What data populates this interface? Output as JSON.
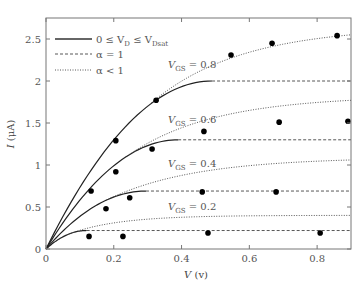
{
  "chart_data": {
    "type": "line",
    "title": "",
    "xlabel": "V (v)",
    "ylabel": "I (μA)",
    "xlim": [
      0,
      0.9
    ],
    "ylim": [
      0,
      2.75
    ],
    "xticks": [
      0,
      0.2,
      0.4,
      0.6,
      0.8
    ],
    "xtick_labels": [
      "0",
      "0.2",
      "0.4",
      "0.6",
      "0.8"
    ],
    "yticks": [
      0,
      0.5,
      1,
      1.5,
      2,
      2.5
    ],
    "ytick_labels": [
      "0",
      "0.5",
      "1",
      "1.5",
      "2",
      "2.5"
    ],
    "grid": false,
    "legend_position": "upper left",
    "legend": [
      {
        "label": "0 ≤ V_D ≤ V_Dsat",
        "style": "solid"
      },
      {
        "label": "α = 1",
        "style": "dashed"
      },
      {
        "label": "α < 1",
        "style": "dotted"
      }
    ],
    "series": [
      {
        "name": "V_GS = 0.8",
        "vgs": 0.8,
        "vdsat": 0.49,
        "isat": 2.0,
        "dotted_end": 2.55,
        "label_pos": [
          0.36,
          2.15
        ]
      },
      {
        "name": "V_GS = 0.6",
        "vgs": 0.6,
        "vdsat": 0.39,
        "isat": 1.3,
        "dotted_end": 1.77,
        "label_pos": [
          0.36,
          1.5
        ]
      },
      {
        "name": "V_GS = 0.4",
        "vgs": 0.4,
        "vdsat": 0.295,
        "isat": 0.69,
        "dotted_end": 1.06,
        "label_pos": [
          0.36,
          0.98
        ]
      },
      {
        "name": "V_GS = 0.2",
        "vgs": 0.2,
        "vdsat": 0.12,
        "isat": 0.22,
        "dotted_end": 0.4,
        "label_pos": [
          0.36,
          0.46
        ]
      }
    ],
    "scatter_points": [
      {
        "x": 0.127,
        "y": 0.15
      },
      {
        "x": 0.227,
        "y": 0.15
      },
      {
        "x": 0.478,
        "y": 0.19
      },
      {
        "x": 0.809,
        "y": 0.19
      },
      {
        "x": 0.133,
        "y": 0.69
      },
      {
        "x": 0.177,
        "y": 0.48
      },
      {
        "x": 0.247,
        "y": 0.61
      },
      {
        "x": 0.461,
        "y": 0.68
      },
      {
        "x": 0.679,
        "y": 0.68
      },
      {
        "x": 0.206,
        "y": 0.92
      },
      {
        "x": 0.206,
        "y": 1.29
      },
      {
        "x": 0.313,
        "y": 1.19
      },
      {
        "x": 0.466,
        "y": 1.4
      },
      {
        "x": 0.688,
        "y": 1.51
      },
      {
        "x": 0.891,
        "y": 1.52
      },
      {
        "x": 0.325,
        "y": 1.77
      },
      {
        "x": 0.546,
        "y": 2.31
      },
      {
        "x": 0.667,
        "y": 2.45
      },
      {
        "x": 0.859,
        "y": 2.54
      }
    ]
  },
  "labels": {
    "xlabel_main": "V",
    "xlabel_unit": " (v)",
    "ylabel_main": "I",
    "ylabel_unit": " (μA)",
    "legend_solid_prefix": "0 ≤ V",
    "legend_solid_sub1": "D",
    "legend_solid_mid": " ≤ V",
    "legend_solid_sub2": "Dsat",
    "legend_dashed": "α = 1",
    "legend_dotted": "α < 1",
    "curve_label_prefix": "V",
    "curve_label_sub": "GS"
  }
}
